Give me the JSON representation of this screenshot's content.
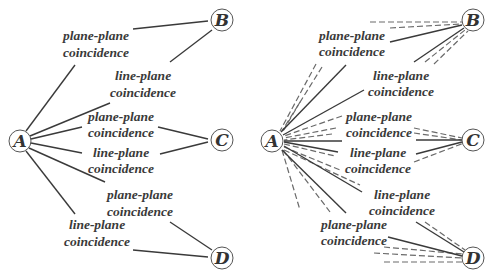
{
  "nodes": {
    "A": "A",
    "B": "B",
    "C": "C",
    "D": "D"
  },
  "left": {
    "labels": [
      {
        "line1": "plane-plane",
        "line2": "coincidence"
      },
      {
        "line1": "line-plane",
        "line2": "coincidence"
      },
      {
        "line1": "plane-plane",
        "line2": "coincidence"
      },
      {
        "line1": "line-plane",
        "line2": "coincidence"
      },
      {
        "line1": "plane-plane",
        "line2": "coincidence"
      },
      {
        "line1": "line-plane",
        "line2": "coincidence"
      }
    ]
  },
  "right": {
    "labels": [
      {
        "line1": "plane-plane",
        "line2": "coincidence"
      },
      {
        "line1": "line-plane",
        "line2": "coincidence"
      },
      {
        "line1": "plane-plane",
        "line2": "coincidence"
      },
      {
        "line1": "line-plane",
        "line2": "coincidence"
      },
      {
        "line1": "line-plane",
        "line2": "coincidence"
      },
      {
        "line1": "plane-plane",
        "line2": "coincidence"
      }
    ]
  }
}
